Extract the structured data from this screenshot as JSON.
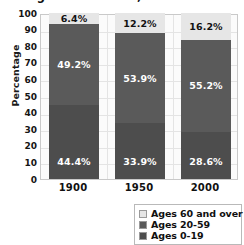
{
  "chart_data": {
    "type": "bar",
    "subtype": "stacked-bar-100pct",
    "title": "Age Distribution, 1900-2000",
    "xlabel": "",
    "ylabel": "Percentage",
    "ylim": [
      0,
      100
    ],
    "ytick_step": 10,
    "yticks": [
      "100",
      "90",
      "80",
      "70",
      "60",
      "50",
      "40",
      "30",
      "20",
      "10",
      "0"
    ],
    "categories": [
      "1900",
      "1950",
      "2000"
    ],
    "grid": true,
    "legend_position": "bottom-right",
    "series": [
      {
        "name": "Ages 0-19",
        "color": "#4d4d4d",
        "values": [
          44.4,
          33.9,
          28.6
        ],
        "labels": [
          "44.4%",
          "33.9%",
          "28.6%"
        ],
        "label_color": "light"
      },
      {
        "name": "Ages 20-59",
        "color": "#5a5a5a",
        "values": [
          49.2,
          53.9,
          55.2
        ],
        "labels": [
          "49.2%",
          "53.9%",
          "55.2%"
        ],
        "label_color": "light"
      },
      {
        "name": "Ages 60 and over",
        "color": "#e6e6e6",
        "values": [
          6.4,
          12.2,
          16.2
        ],
        "labels": [
          "6.4%",
          "12.2%",
          "16.2%"
        ],
        "label_color": "dark"
      }
    ]
  },
  "legend": {
    "items": [
      {
        "label": "Ages 60 and over",
        "color": "#e6e6e6"
      },
      {
        "label": "Ages 20-59",
        "color": "#5a5a5a"
      },
      {
        "label": "Ages 0-19",
        "color": "#4d4d4d"
      }
    ]
  }
}
